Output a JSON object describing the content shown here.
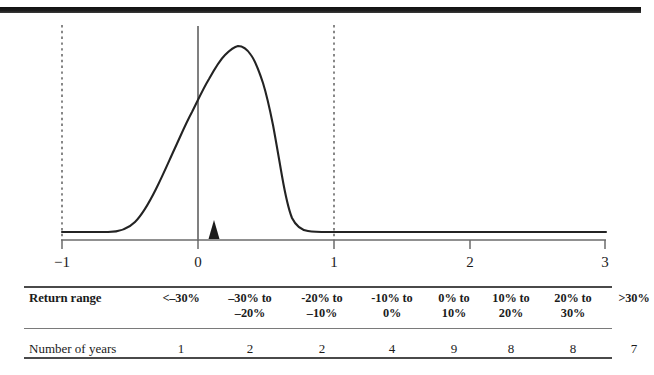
{
  "figure": {
    "title": "",
    "top_rule_color": "#111111",
    "curve_color": "#222222",
    "axis_color": "#5a5a5a",
    "dashed_color": "#555555",
    "marker_name": "mean-marker-triangle"
  },
  "axis": {
    "ticks": [
      {
        "label": "−1",
        "value": -1
      },
      {
        "label": "0",
        "value": 0
      },
      {
        "label": "1",
        "value": 1
      },
      {
        "label": "2",
        "value": 2
      },
      {
        "label": "3",
        "value": 3
      }
    ],
    "range": [
      -1,
      3
    ],
    "reference_lines": [
      {
        "name": "dashed-line-minus-1",
        "value": -1,
        "style": "dashed"
      },
      {
        "name": "solid-line-zero",
        "value": 0,
        "style": "solid"
      },
      {
        "name": "dashed-line-one",
        "value": 1,
        "style": "dashed"
      }
    ],
    "marker": {
      "name": "triangle-marker",
      "value": 0.12
    }
  },
  "table": {
    "rows": [
      {
        "label": "Return range",
        "bold": true,
        "cells": [
          "<–30%",
          "–30% to\n–20%",
          "-20% to\n–10%",
          "-10% to\n0%",
          "0% to\n10%",
          "10% to\n20%",
          "20% to\n30%",
          ">30%"
        ]
      },
      {
        "label": "Number of years",
        "bold": false,
        "cells": [
          "1",
          "2",
          "2",
          "4",
          "9",
          "8",
          "8",
          "7"
        ]
      }
    ]
  },
  "chart_data": {
    "type": "line",
    "title": "",
    "xlabel": "",
    "ylabel": "",
    "xlim": [
      -1,
      3
    ],
    "ylim": [
      0,
      1
    ],
    "grid": false,
    "legend": null,
    "categories": [
      "<–30%",
      "–30% to –20%",
      "-20% to –10%",
      "-10% to 0%",
      "0% to 10%",
      "10% to 20%",
      "20% to 30%",
      ">30%"
    ],
    "values": [
      1,
      2,
      2,
      4,
      9,
      8,
      8,
      7
    ],
    "series": [
      {
        "name": "density",
        "x": [
          -1.0,
          -0.8,
          -0.7,
          -0.62,
          -0.55,
          -0.48,
          -0.42,
          -0.36,
          -0.3,
          -0.24,
          -0.18,
          -0.12,
          -0.06,
          0.0,
          0.05,
          0.1,
          0.15,
          0.2,
          0.23,
          0.27,
          0.31,
          0.35,
          0.4,
          0.45,
          0.5,
          0.55,
          0.62,
          0.7,
          0.8,
          1.0,
          1.5,
          2.0,
          2.5,
          3.0
        ],
        "y": [
          0.0,
          0.0,
          0.005,
          0.02,
          0.05,
          0.1,
          0.17,
          0.25,
          0.33,
          0.42,
          0.52,
          0.63,
          0.76,
          0.86,
          0.92,
          0.96,
          0.99,
          1.0,
          0.995,
          0.96,
          0.88,
          0.76,
          0.58,
          0.4,
          0.24,
          0.13,
          0.05,
          0.015,
          0.003,
          0.0,
          0.0,
          0.0,
          0.0,
          0.0
        ]
      }
    ],
    "annotations": [
      {
        "name": "dashed-reference-minus-1",
        "x": -1
      },
      {
        "name": "solid-reference-zero",
        "x": 0
      },
      {
        "name": "dashed-reference-one",
        "x": 1
      },
      {
        "name": "triangle-marker",
        "x": 0.12
      }
    ]
  }
}
